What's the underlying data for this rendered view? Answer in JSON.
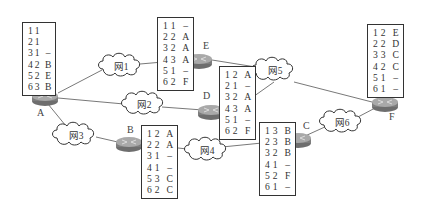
{
  "routers": [
    {
      "id": "A",
      "label": "A",
      "table": [
        [
          "1",
          "1",
          ""
        ],
        [
          "2",
          "1",
          ""
        ],
        [
          "3",
          "1",
          "–"
        ],
        [
          "4",
          "2",
          "B"
        ],
        [
          "5",
          "2",
          "E"
        ],
        [
          "6",
          "3",
          "B"
        ]
      ]
    },
    {
      "id": "B",
      "label": "B",
      "table": [
        [
          "1",
          "2",
          "A"
        ],
        [
          "2",
          "2",
          "A"
        ],
        [
          "3",
          "1",
          "–"
        ],
        [
          "4",
          "1",
          "–"
        ],
        [
          "5",
          "3",
          "C"
        ],
        [
          "6",
          "2",
          "C"
        ]
      ]
    },
    {
      "id": "C",
      "label": "C",
      "table": [
        [
          "1",
          "3",
          "B"
        ],
        [
          "2",
          "3",
          "B"
        ],
        [
          "3",
          "2",
          "B"
        ],
        [
          "4",
          "1",
          "–"
        ],
        [
          "5",
          "2",
          "F"
        ],
        [
          "6",
          "1",
          "–"
        ]
      ]
    },
    {
      "id": "D",
      "label": "D",
      "table": [
        [
          "1",
          "2",
          "A"
        ],
        [
          "2",
          "1",
          "–"
        ],
        [
          "3",
          "2",
          "A"
        ],
        [
          "4",
          "3",
          "A"
        ],
        [
          "5",
          "1",
          "–"
        ],
        [
          "6",
          "2",
          "F"
        ]
      ]
    },
    {
      "id": "E",
      "label": "E",
      "table": [
        [
          "1",
          "1",
          "–"
        ],
        [
          "2",
          "2",
          "A"
        ],
        [
          "3",
          "2",
          "A"
        ],
        [
          "4",
          "3",
          "A"
        ],
        [
          "5",
          "1",
          "–"
        ],
        [
          "6",
          "2",
          "F"
        ]
      ]
    },
    {
      "id": "F",
      "label": "F",
      "table": [
        [
          "1",
          "2",
          "E"
        ],
        [
          "2",
          "2",
          "D"
        ],
        [
          "3",
          "3",
          "C"
        ],
        [
          "4",
          "2",
          "C"
        ],
        [
          "5",
          "1",
          "–"
        ],
        [
          "6",
          "1",
          "–"
        ]
      ]
    }
  ],
  "networks": [
    {
      "id": "net1",
      "label": "网1"
    },
    {
      "id": "net2",
      "label": "网2"
    },
    {
      "id": "net3",
      "label": "网3"
    },
    {
      "id": "net4",
      "label": "网4"
    },
    {
      "id": "net5",
      "label": "网5"
    },
    {
      "id": "net6",
      "label": "网6"
    }
  ],
  "colors": {
    "router_body": "#8a8a8a",
    "router_top": "#b5b5b5",
    "line": "#555555",
    "text": "#333333"
  }
}
